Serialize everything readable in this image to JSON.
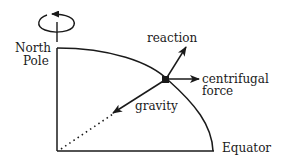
{
  "diagram": {
    "labels": {
      "north_pole_line1": "North",
      "north_pole_line2": "Pole",
      "equator": "Equator",
      "reaction": "reaction",
      "centrifugal_line1": "centrifugal",
      "centrifugal_line2": "force",
      "gravity": "gravity"
    },
    "icons": {
      "rotation": "rotation-arrow-icon"
    },
    "colors": {
      "ink": "#1a1a1a",
      "background": "#ffffff"
    }
  }
}
